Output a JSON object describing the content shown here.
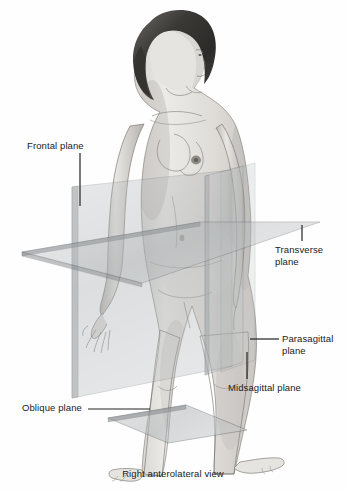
{
  "figure": {
    "caption": "Right anterolateral view",
    "background_color": "#fefefe",
    "label_color": "#1a1a1a",
    "leader_color": "#222222",
    "subject_description": "Grayscale illustration of a standing adult female figure, right anterolateral view, with four transparent anatomical section planes intersecting the body"
  },
  "labels": {
    "frontal": "Frontal plane",
    "transverse": "Transverse\nplane",
    "parasagittal": "Parasagittal\nplane",
    "midsagittal": "Midsagittal plane",
    "oblique": "Oblique plane"
  },
  "planes": [
    {
      "name": "frontal-plane",
      "label": "Frontal plane",
      "orientation": "vertical-coronal",
      "fill": "#b9bcbd",
      "opacity": 0.34,
      "stroke": "#6e7274",
      "points": "72,187 232,170 232,366 72,398"
    },
    {
      "name": "transverse-plane",
      "label": "Transverse plane",
      "orientation": "horizontal-axial",
      "fill": "#a9adaf",
      "opacity": 0.42,
      "stroke": "#63676a",
      "points": "22,252 200,222 320,222 142,283"
    },
    {
      "name": "parasagittal-plane",
      "label": "Parasagittal plane",
      "orientation": "vertical-sagittal-lateral",
      "fill": "#b4b7b9",
      "opacity": 0.3,
      "stroke": "#6b6f72",
      "points": "205,176 243,166 243,362 205,375"
    },
    {
      "name": "midsagittal-plane",
      "label": "Midsagittal plane",
      "orientation": "vertical-sagittal-median",
      "fill": "#b0b3b6",
      "opacity": 0.26,
      "stroke": "#6b6f72",
      "points": "221,172 255,163 255,360 221,372"
    },
    {
      "name": "oblique-plane",
      "label": "Oblique plane",
      "orientation": "tilted-oblique",
      "fill": "#aeb1b3",
      "opacity": 0.5,
      "stroke": "#5f6366",
      "points": "108,418 186,405 247,430 168,443"
    }
  ],
  "leaders": [
    {
      "name": "frontal-leader",
      "x1": 80,
      "y1": 153,
      "x2": 80,
      "y2": 206
    },
    {
      "name": "transverse-leader",
      "x1": 302,
      "y1": 225,
      "x2": 302,
      "y2": 241
    },
    {
      "name": "parasagittal-leader",
      "x1": 250,
      "y1": 339,
      "x2": 279,
      "y2": 339
    },
    {
      "name": "midsagittal-leader",
      "x1": 247,
      "y1": 352,
      "x2": 247,
      "y2": 379
    },
    {
      "name": "oblique-leader",
      "x1": 88,
      "y1": 409,
      "x2": 150,
      "y2": 409
    }
  ]
}
